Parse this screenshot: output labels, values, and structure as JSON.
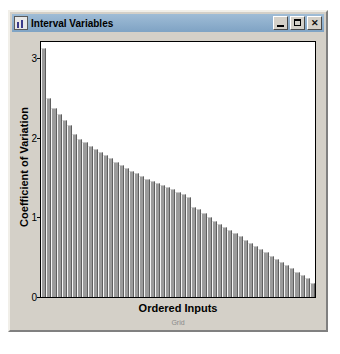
{
  "window": {
    "title": "Interval Variables",
    "icon": "chart-icon",
    "buttons": {
      "minimize": "minimize-button",
      "maximize": "maximize-button",
      "close": "✕"
    }
  },
  "chart_data": {
    "type": "bar",
    "title": "",
    "xlabel": "Ordered Inputs",
    "ylabel": "Coefficient of Variation",
    "sublabel": "Grid",
    "grid": false,
    "legend": null,
    "ylim": [
      0,
      3.2
    ],
    "yticks": [
      0,
      1,
      2,
      3
    ],
    "ytick_labels": [
      "0",
      "1",
      "2",
      "3"
    ],
    "categories": [
      "1",
      "2",
      "3",
      "4",
      "5",
      "6",
      "7",
      "8",
      "9",
      "10",
      "11",
      "12",
      "13",
      "14",
      "15",
      "16",
      "17",
      "18",
      "19",
      "20",
      "21",
      "22",
      "23",
      "24",
      "25",
      "26",
      "27",
      "28",
      "29",
      "30",
      "31",
      "32",
      "33",
      "34",
      "35",
      "36",
      "37",
      "38",
      "39",
      "40",
      "41",
      "42",
      "43",
      "44",
      "45",
      "46",
      "47",
      "48",
      "49",
      "50",
      "51",
      "52",
      "53"
    ],
    "values": [
      3.12,
      2.5,
      2.37,
      2.3,
      2.22,
      2.16,
      2.05,
      1.98,
      1.94,
      1.9,
      1.86,
      1.82,
      1.78,
      1.74,
      1.7,
      1.66,
      1.62,
      1.58,
      1.55,
      1.52,
      1.48,
      1.45,
      1.43,
      1.41,
      1.38,
      1.35,
      1.32,
      1.29,
      1.25,
      1.13,
      1.1,
      1.05,
      1.0,
      0.96,
      0.92,
      0.88,
      0.84,
      0.8,
      0.76,
      0.72,
      0.68,
      0.64,
      0.6,
      0.56,
      0.52,
      0.48,
      0.44,
      0.4,
      0.36,
      0.32,
      0.28,
      0.24,
      0.18
    ]
  }
}
